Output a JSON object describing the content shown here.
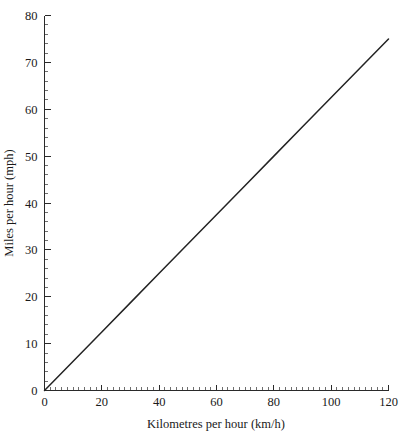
{
  "chart_data": {
    "type": "line",
    "title": "",
    "xlabel": "Kilometres per hour (km/h)",
    "ylabel": "Miles per hour (mph)",
    "xlim": [
      0,
      120
    ],
    "ylim": [
      0,
      80
    ],
    "grid": false,
    "legend": "none",
    "x_major_ticks": [
      0,
      20,
      40,
      60,
      80,
      100,
      120
    ],
    "y_major_ticks": [
      0,
      10,
      20,
      30,
      40,
      50,
      60,
      70,
      80
    ],
    "x_tick_labels": [
      "0",
      "20",
      "40",
      "60",
      "80",
      "100",
      "120"
    ],
    "y_tick_labels": [
      "0",
      "10",
      "20",
      "30",
      "40",
      "50",
      "60",
      "70",
      "80"
    ],
    "x_minor_tick_step": 2,
    "y_minor_tick_step": 2,
    "series": [
      {
        "name": "km/h to mph conversion",
        "color": "#232323",
        "x": [
          0,
          120
        ],
        "values": [
          0,
          75
        ],
        "points": [
          {
            "x": 0,
            "y": 0
          },
          {
            "x": 10,
            "y": 6.25
          },
          {
            "x": 20,
            "y": 12.5
          },
          {
            "x": 30,
            "y": 18.75
          },
          {
            "x": 40,
            "y": 25
          },
          {
            "x": 50,
            "y": 31.25
          },
          {
            "x": 60,
            "y": 37.5
          },
          {
            "x": 70,
            "y": 43.75
          },
          {
            "x": 80,
            "y": 50
          },
          {
            "x": 90,
            "y": 56.25
          },
          {
            "x": 100,
            "y": 62.5
          },
          {
            "x": 110,
            "y": 68.75
          },
          {
            "x": 120,
            "y": 75
          }
        ]
      }
    ]
  },
  "figure": {
    "background_color": "#ffffff",
    "axis_color": "#2a2a2a",
    "line_color": "#232323",
    "text_color": "#1a1a1a"
  }
}
